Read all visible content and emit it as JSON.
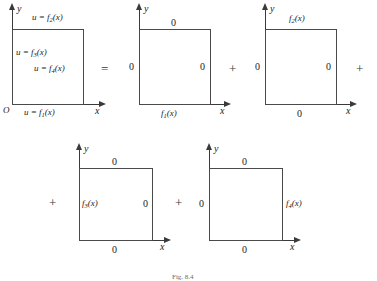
{
  "figure": {
    "caption": "Fig. 8.4",
    "operators": {
      "equals": "=",
      "plus": "+"
    },
    "axis": {
      "x": "x",
      "y": "y",
      "origin": "O"
    },
    "zero": "0"
  },
  "panels": [
    {
      "id": "original",
      "name": "original-problem",
      "bottom_label": "u = f",
      "bottom_sub": "1",
      "bottom_tail": "(x)",
      "top_label": "u = f",
      "top_sub": "2",
      "top_tail": "(x)",
      "left_label": "u = f",
      "left_sub": "3",
      "left_tail": "(x)",
      "right_label": "u = f",
      "right_sub": "4",
      "right_tail": "(x)",
      "show_origin": true
    },
    {
      "id": "sub1",
      "name": "subproblem-f1",
      "bottom_label": "f",
      "bottom_sub": "1",
      "bottom_tail": "(x)",
      "top_label": "0",
      "left_label": "0",
      "right_label": "0",
      "show_origin": false
    },
    {
      "id": "sub2",
      "name": "subproblem-f2",
      "bottom_label": "0",
      "top_label": "f",
      "top_sub": "2",
      "top_tail": "(x)",
      "left_label": "0",
      "right_label": "0",
      "show_origin": false
    },
    {
      "id": "sub3",
      "name": "subproblem-f3",
      "bottom_label": "0",
      "top_label": "0",
      "left_label": "f",
      "left_sub": "3",
      "left_tail": "(x)",
      "right_label": "0",
      "show_origin": false
    },
    {
      "id": "sub4",
      "name": "subproblem-f4",
      "bottom_label": "0",
      "top_label": "0",
      "left_label": "0",
      "right_label": "f",
      "right_sub": "4",
      "right_tail": "(x)",
      "show_origin": false
    }
  ]
}
